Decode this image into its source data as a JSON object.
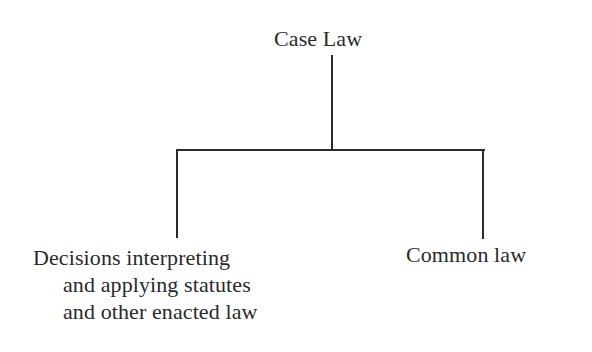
{
  "diagram": {
    "type": "tree",
    "root": {
      "label": "Case Law"
    },
    "children": [
      {
        "label_lines": [
          "Decisions interpreting",
          "and applying statutes",
          "and other enacted law"
        ]
      },
      {
        "label": "Common law"
      }
    ],
    "colors": {
      "text": "#2a2a2a",
      "lines": "#2b2b2b",
      "background": "#ffffff"
    }
  }
}
